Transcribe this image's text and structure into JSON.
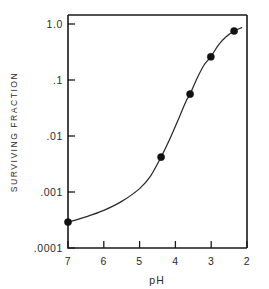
{
  "chart_data": {
    "type": "line",
    "title": "",
    "xlabel": "pH",
    "ylabel": "SURVIVING FRACTION",
    "xlim": [
      7,
      2
    ],
    "ylim": [
      0.0001,
      1.0
    ],
    "yscale": "log",
    "xscale": "linear",
    "x_inverted": true,
    "grid": false,
    "legend": null,
    "xticks": [
      7,
      6,
      5,
      4,
      3,
      2
    ],
    "xticklabels": [
      "7",
      "6",
      "5",
      "4",
      "3",
      "2"
    ],
    "yticks": [
      1.0,
      0.1,
      0.01,
      0.001,
      0.0001
    ],
    "yticklabels": [
      "1.0",
      ".1",
      ".01",
      ".001",
      ".0001"
    ],
    "marker": "filled-circle",
    "marker_color": "#111111",
    "line_color": "#2a2a2a",
    "points": [
      {
        "x": 7.0,
        "y": 0.00029
      },
      {
        "x": 4.4,
        "y": 0.0042
      },
      {
        "x": 3.59,
        "y": 0.056
      },
      {
        "x": 3.01,
        "y": 0.26
      },
      {
        "x": 2.36,
        "y": 0.75
      }
    ],
    "curve": [
      {
        "x": 7.0,
        "y": 0.00029
      },
      {
        "x": 6.5,
        "y": 0.00036
      },
      {
        "x": 6.0,
        "y": 0.00047
      },
      {
        "x": 5.5,
        "y": 0.00068
      },
      {
        "x": 5.0,
        "y": 0.00115
      },
      {
        "x": 4.7,
        "y": 0.0019
      },
      {
        "x": 4.4,
        "y": 0.0042
      },
      {
        "x": 4.15,
        "y": 0.009
      },
      {
        "x": 3.9,
        "y": 0.021
      },
      {
        "x": 3.7,
        "y": 0.042
      },
      {
        "x": 3.59,
        "y": 0.056
      },
      {
        "x": 3.4,
        "y": 0.105
      },
      {
        "x": 3.2,
        "y": 0.185
      },
      {
        "x": 3.01,
        "y": 0.26
      },
      {
        "x": 2.8,
        "y": 0.42
      },
      {
        "x": 2.6,
        "y": 0.58
      },
      {
        "x": 2.36,
        "y": 0.75
      },
      {
        "x": 2.15,
        "y": 0.86
      }
    ]
  },
  "axes": {
    "x_title": "pH",
    "y_title": "SURVIVING FRACTION"
  }
}
